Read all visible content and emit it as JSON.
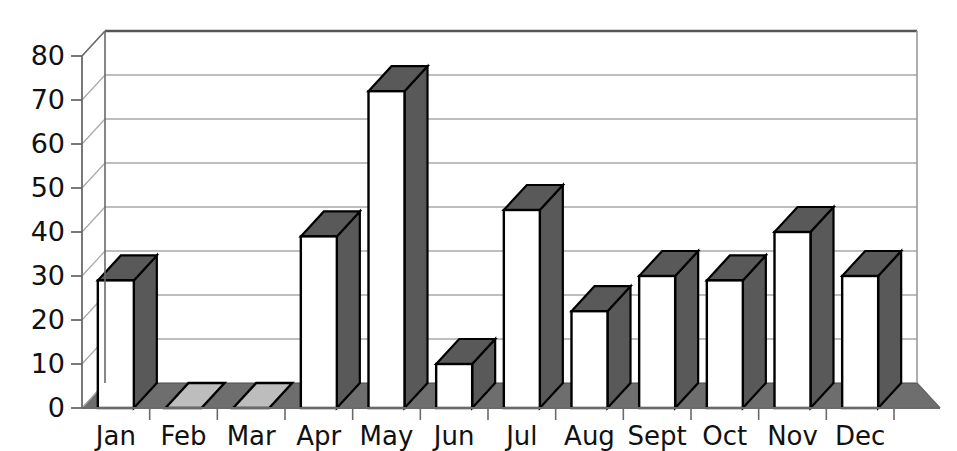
{
  "chart_data": {
    "type": "bar",
    "title": "",
    "subtitle": "",
    "xlabel": "",
    "ylabel": "",
    "categories": [
      "Jan",
      "Feb",
      "Mar",
      "Apr",
      "May",
      "Jun",
      "Jul",
      "Aug",
      "Sept",
      "Oct",
      "Nov",
      "Dec"
    ],
    "values": [
      29,
      0,
      0,
      39,
      72,
      10,
      45,
      22,
      30,
      29,
      40,
      30
    ],
    "ylim": [
      0,
      80
    ],
    "ytick_labels": [
      "0",
      "10",
      "20",
      "30",
      "40",
      "50",
      "60",
      "70",
      "80"
    ],
    "ytick_values": [
      0,
      10,
      20,
      30,
      40,
      50,
      60,
      70,
      80
    ],
    "grid": true,
    "grid_axis": "y",
    "legend": false,
    "legend_position": "none",
    "style": "3d-column",
    "colors": {
      "bar_front": "#ffffff",
      "bar_side": "#595959",
      "bar_top": "#595959",
      "bar_outline": "#000000",
      "floor": "#6e6e6e",
      "wall": "#ffffff",
      "grid_line": "#a8a8a8",
      "axis_line": "#6a6a6a",
      "text": "#111111",
      "background": "#ffffff"
    }
  },
  "axes": {
    "y_axis_name": "value-axis",
    "x_axis_name": "category-axis"
  }
}
